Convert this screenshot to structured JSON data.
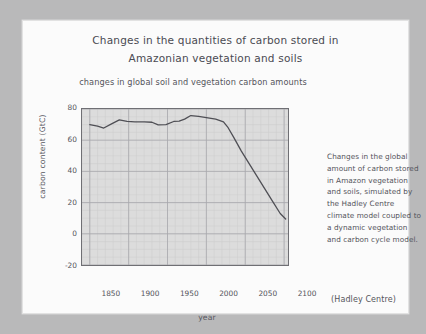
{
  "slide": {
    "title_line1": "Changes in the quantities of carbon stored in",
    "title_line2": "Amazonian vegetation and soils",
    "subtitle": "changes in global soil and vegetation carbon amounts",
    "caption": "Changes in the global amount of carbon stored in Amazon vegetation and soils, simulated by the Hadley Centre climate model coupled to a dynamic vegetation and carbon cycle model.",
    "credit": "(Hadley Centre)"
  },
  "colors": {
    "page_background": "#b9b9ba",
    "card_background": "#fbfbfb",
    "plot_background": "#dcdcdc",
    "line": "#4f4f55",
    "text": "#55555c",
    "title_text": "#4a4a52",
    "grid_major": "#a8a8ad",
    "grid_minor": "#cdcdcd",
    "axis_frame": "#6f6f74"
  },
  "chart_data": {
    "type": "line",
    "title": "changes in global soil and vegetation carbon amounts",
    "xlabel": "year",
    "ylabel": "carbon content (GtC)",
    "xlim": [
      1840,
      2105
    ],
    "ylim": [
      -20,
      80
    ],
    "xticks": [
      1850,
      1900,
      1950,
      2000,
      2050,
      2100
    ],
    "yticks": [
      -20,
      0,
      20,
      40,
      60,
      80
    ],
    "grid": true,
    "legend": "none",
    "series": [
      {
        "name": "Amazon vegetation and soil carbon",
        "x": [
          1850,
          1860,
          1868,
          1878,
          1888,
          1898,
          1908,
          1920,
          1930,
          1938,
          1948,
          1958,
          1965,
          1972,
          1980,
          1990,
          2000,
          2012,
          2022,
          2028,
          2035,
          2045,
          2055,
          2065,
          2075,
          2085,
          2095,
          2102
        ],
        "values": [
          70.0,
          69.0,
          67.8,
          70.5,
          73.0,
          72.0,
          71.8,
          71.8,
          71.5,
          69.8,
          70.0,
          72.0,
          72.2,
          73.5,
          75.8,
          75.2,
          74.5,
          73.5,
          71.8,
          68.0,
          62.0,
          53.0,
          45.0,
          37.0,
          29.0,
          21.0,
          13.0,
          9.5
        ]
      }
    ]
  }
}
